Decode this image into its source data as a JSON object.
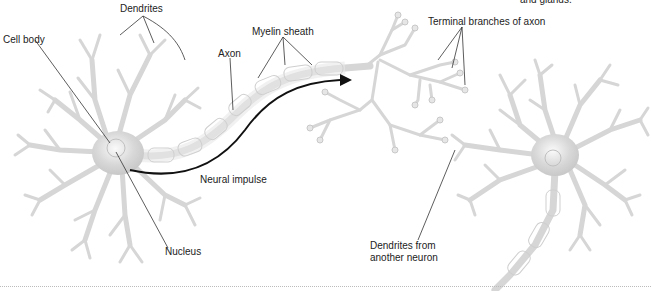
{
  "diagram": {
    "top_right_fragment": "and glands.",
    "labels": {
      "dendrites": "Dendrites",
      "cell_body": "Cell body",
      "axon": "Axon",
      "myelin_sheath": "Myelin sheath",
      "terminal_branches": "Terminal branches of axon",
      "neural_impulse": "Neural impulse",
      "nucleus": "Nucleus",
      "dendrites_from_another_line1": "Dendrites from",
      "dendrites_from_another_line2": "another neuron"
    },
    "colors": {
      "neuron_fill": "#dcdcdc",
      "neuron_stroke": "#c4c4c4",
      "soma_highlight": "#f4f4f4",
      "leader_line": "#333333",
      "impulse_arrow": "#111111",
      "text": "#222222"
    }
  }
}
